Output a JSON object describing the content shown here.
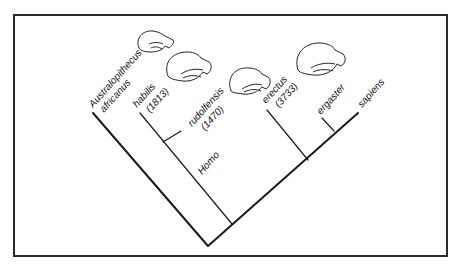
{
  "diagram": {
    "type": "cladogram",
    "taxa": [
      {
        "id": "australopithecus",
        "lines": [
          "Australopithecus",
          "africanus"
        ]
      },
      {
        "id": "habilis",
        "lines": [
          "habilis",
          "(1813)"
        ]
      },
      {
        "id": "rudolfensis",
        "lines": [
          "rudolfensis",
          "(1470)"
        ]
      },
      {
        "id": "erectus",
        "lines": [
          "erectus",
          "(3733)"
        ]
      },
      {
        "id": "ergaster",
        "lines": [
          "ergaster"
        ]
      },
      {
        "id": "sapiens",
        "lines": [
          "sapiens"
        ]
      }
    ],
    "clade_label": "Homo",
    "skull_icons": [
      "australopithecus-skull",
      "habilis-skull",
      "rudolfensis-skull",
      "erectus-skull"
    ]
  }
}
